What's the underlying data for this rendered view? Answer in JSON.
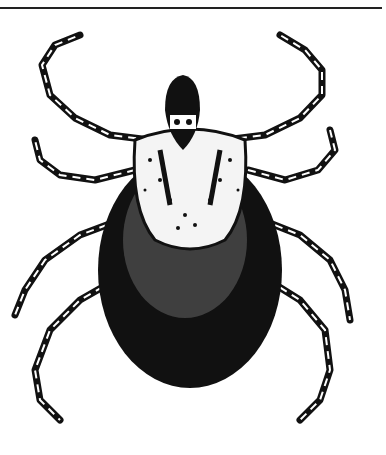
{
  "image": {
    "subject": "tick illustration",
    "style": "black and white ink drawing",
    "colors": {
      "ink": "#111111",
      "paper": "#ffffff"
    }
  }
}
